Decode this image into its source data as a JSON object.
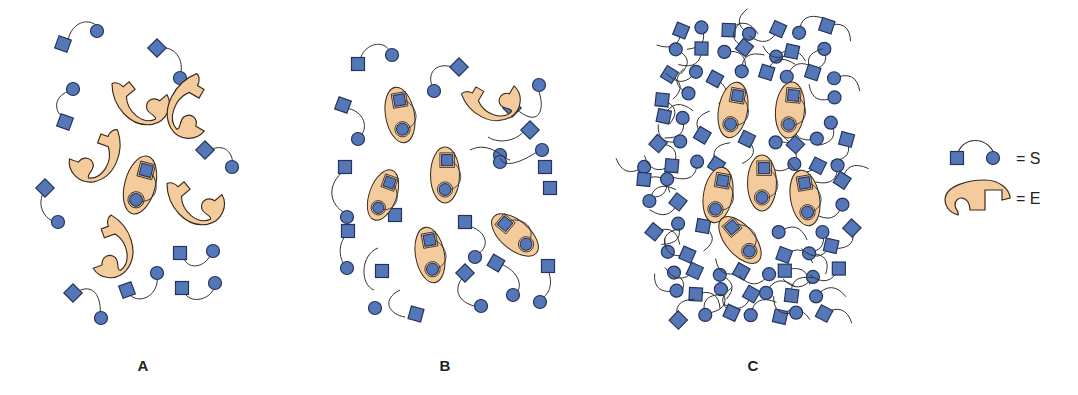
{
  "colors": {
    "substrate_fill": "#5577b8",
    "substrate_stroke": "#23355e",
    "enzyme_fill": "#f3cb9c",
    "enzyme_stroke": "#3a2a1a",
    "linker": "#333333"
  },
  "panels": [
    {
      "label": "A",
      "label_pos": [
        143,
        367
      ],
      "free_substrates": [
        [
          68,
          95,
          120,
          50,
          0
        ],
        [
          158,
          48,
          182,
          78,
          1
        ],
        [
          68,
          92,
          62,
          70,
          2
        ],
        [
          63,
          120,
          0,
          0,
          0
        ],
        [
          208,
          150,
          233,
          165,
          0
        ],
        [
          45,
          187,
          58,
          222,
          3
        ],
        [
          180,
          253,
          212,
          255,
          0
        ],
        [
          73,
          293,
          100,
          318,
          0
        ],
        [
          126,
          290,
          157,
          275,
          0
        ],
        [
          182,
          290,
          215,
          285,
          0
        ]
      ],
      "enzymes_free": [
        [
          140,
          95,
          -35
        ],
        [
          195,
          105,
          30
        ],
        [
          97,
          150,
          20
        ],
        [
          105,
          245,
          -25
        ],
        [
          195,
          195,
          -35
        ]
      ],
      "enzymes_bound": [
        [
          140,
          185,
          15
        ]
      ]
    },
    {
      "label": "B",
      "label_pos": [
        445,
        367
      ],
      "free_substrates": [
        [
          358,
          62,
          392,
          55,
          0
        ],
        [
          459,
          66,
          434,
          90,
          2
        ],
        [
          341,
          105,
          358,
          138,
          3
        ],
        [
          539,
          108,
          545,
          85,
          0
        ],
        [
          513,
          143,
          532,
          168,
          0
        ],
        [
          344,
          165,
          350,
          218,
          3
        ],
        [
          378,
          255,
          398,
          257,
          0
        ],
        [
          454,
          180,
          474,
          210,
          0
        ],
        [
          353,
          260,
          373,
          270,
          0
        ],
        [
          462,
          250,
          483,
          262,
          0
        ],
        [
          496,
          232,
          519,
          275,
          0
        ],
        [
          550,
          240,
          540,
          295,
          0
        ],
        [
          381,
          270,
          370,
          300,
          0
        ],
        [
          404,
          315,
          0,
          0,
          0
        ],
        [
          468,
          288,
          463,
          300,
          0
        ],
        [
          515,
          265,
          500,
          268,
          0
        ]
      ],
      "enzymes_free": [
        [
          390,
          125,
          5
        ],
        [
          490,
          98,
          -60
        ]
      ],
      "enzymes_bound": [
        [
          405,
          110,
          10
        ],
        [
          380,
          195,
          -20
        ],
        [
          450,
          180,
          0
        ],
        [
          432,
          258,
          -15
        ],
        [
          510,
          235,
          -50
        ]
      ]
    },
    {
      "label": "C",
      "label_pos": [
        753,
        367
      ],
      "free_substrates": "dense",
      "enzymes_bound": [
        [
          733,
          110,
          10
        ],
        [
          790,
          110,
          5
        ],
        [
          718,
          195,
          10
        ],
        [
          762,
          183,
          0
        ],
        [
          805,
          198,
          -10
        ],
        [
          740,
          240,
          -40
        ]
      ]
    }
  ],
  "legend": {
    "substrate": {
      "text": "= S"
    },
    "enzyme": {
      "text": "= E"
    }
  }
}
